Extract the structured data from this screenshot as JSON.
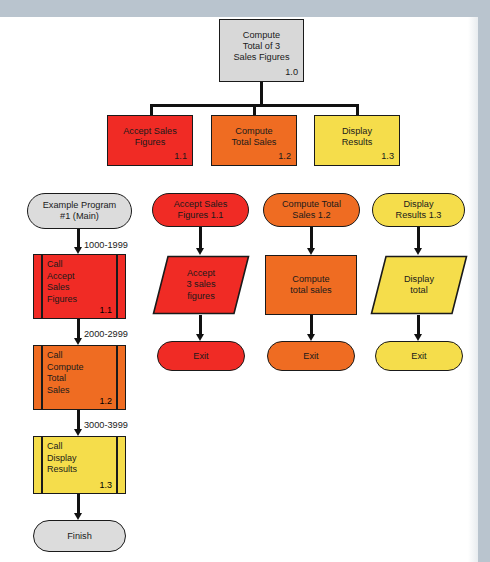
{
  "diagram": {
    "title_text": "Structure chart and flowcharts for a 3-sales-figure total program",
    "colors": {
      "module_1_1": "#f02b25",
      "module_1_2": "#ef6c22",
      "module_1_3": "#f5dd4b",
      "main_module": "#d8d8d8",
      "outline": "#1a1a1a",
      "scan_edge": "#b9c4ce"
    }
  },
  "hierarchy_chart": {
    "root": {
      "label": "Compute\nTotal of 3\nSales Figures",
      "number": "1.0"
    },
    "children": [
      {
        "label": "Accept Sales\nFigures",
        "number": "1.1"
      },
      {
        "label": "Compute\nTotal Sales",
        "number": "1.2"
      },
      {
        "label": "Display\nResults",
        "number": "1.3"
      }
    ]
  },
  "flowcharts": [
    {
      "id": "main",
      "terminal_start": "Example Program\n#1 (Main)",
      "steps": [
        {
          "range": "1000-1999",
          "label": "Call\nAccept\nSales\nFigures",
          "number": "1.1"
        },
        {
          "range": "2000-2999",
          "label": "Call\nCompute\nTotal\nSales",
          "number": "1.2"
        },
        {
          "range": "3000-3999",
          "label": "Call\nDisplay\nResults",
          "number": "1.3"
        }
      ],
      "terminal_end": "Finish"
    },
    {
      "id": "accept-sales-figures",
      "header": "Accept Sales\nFigures   1.1",
      "process": "Accept\n3 sales\nfigures",
      "process_shape": "parallelogram",
      "terminal_end": "Exit"
    },
    {
      "id": "compute-total-sales",
      "header": "Compute Total\nSales          1.2",
      "process": "Compute\ntotal sales",
      "process_shape": "rectangle",
      "terminal_end": "Exit"
    },
    {
      "id": "display-results",
      "header": "Display\nResults   1.3",
      "process": "Display\ntotal",
      "process_shape": "parallelogram",
      "terminal_end": "Exit"
    }
  ]
}
